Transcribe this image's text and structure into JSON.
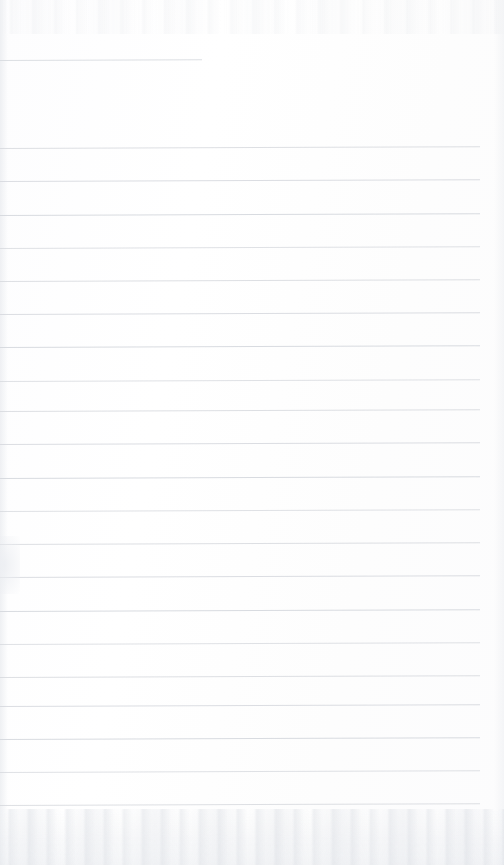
{
  "document": {
    "kind": "scanned-page",
    "description": "Blank scanned lined notebook page",
    "page_width": 504,
    "page_height": 865,
    "background_color": "#fdfdfd",
    "rule_color": "#d6d9de",
    "rule_thickness_px": 1,
    "text_content": "",
    "visible_text": []
  },
  "layout": {
    "left_margin_px": 0,
    "right_margin_px": 24,
    "rule_right_edge_px": 480,
    "line_spacing_px": 33.3,
    "rule_tilt_deg": -0.22,
    "first_full_rule_y": 148,
    "last_full_rule_y": 805,
    "full_rule_count": 21
  },
  "short_rule": {
    "name": "partial-top-rule",
    "y": 60,
    "start_x": 0,
    "end_x": 202,
    "length_px": 202
  },
  "full_rules": [
    {
      "index": 1,
      "y": 148
    },
    {
      "index": 2,
      "y": 181
    },
    {
      "index": 3,
      "y": 215
    },
    {
      "index": 4,
      "y": 248
    },
    {
      "index": 5,
      "y": 281
    },
    {
      "index": 6,
      "y": 314
    },
    {
      "index": 7,
      "y": 347
    },
    {
      "index": 8,
      "y": 381
    },
    {
      "index": 9,
      "y": 411
    },
    {
      "index": 10,
      "y": 444
    },
    {
      "index": 11,
      "y": 478
    },
    {
      "index": 12,
      "y": 511
    },
    {
      "index": 13,
      "y": 544
    },
    {
      "index": 14,
      "y": 577
    },
    {
      "index": 15,
      "y": 611
    },
    {
      "index": 16,
      "y": 644
    },
    {
      "index": 17,
      "y": 677
    },
    {
      "index": 18,
      "y": 706
    },
    {
      "index": 19,
      "y": 739
    },
    {
      "index": 20,
      "y": 772
    },
    {
      "index": 21,
      "y": 805
    }
  ],
  "artifacts": {
    "top_noise_band": true,
    "bottom_noise_band": true,
    "left_edge_shadow": true,
    "right_edge_shadow": true,
    "left_margin_smudge_y": 560
  }
}
